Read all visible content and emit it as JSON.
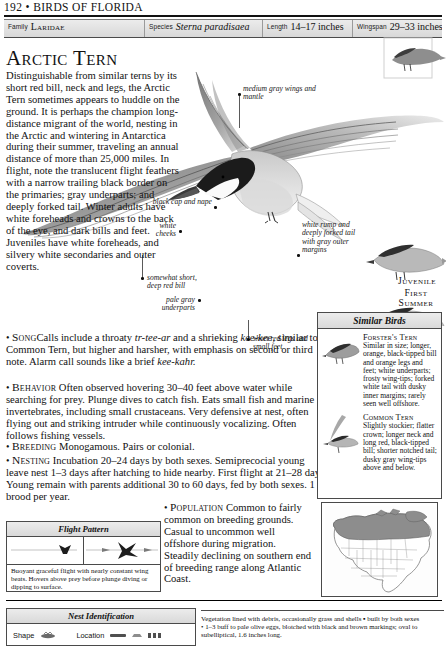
{
  "running_head": {
    "page_number": "192",
    "separator": "•",
    "book_title": "BIRDS OF FLORIDA"
  },
  "header_table": {
    "fields": [
      {
        "label": "Family",
        "value": "Laridae",
        "style": "small-caps"
      },
      {
        "label": "Species",
        "value": "Sterna paradisaea",
        "style": "italic"
      },
      {
        "label": "Length",
        "value": "14–17 inches",
        "style": "plain"
      },
      {
        "label": "Wingspan",
        "value": "29–33 inches",
        "style": "plain"
      }
    ]
  },
  "species": {
    "title": "Arctic Tern",
    "description": "Distinguishable from similar terns by its short red bill, neck and legs, the Arctic Tern sometimes appears to huddle on the ground. It is perhaps the champion long-distance migrant of the world, nesting in the Arctic and wintering in Antarctica during their summer, traveling an annual distance of more than 25,000 miles. In flight, note the translucent flight feathers with a narrow trailing black border on the primaries; gray underparts; and deeply forked tail. Winter adults have white foreheads and crowns to the back of the eye, and dark bills and feet. Juveniles have white foreheads, and silvery white secondaries and outer coverts."
  },
  "sections": [
    {
      "heading": "Song",
      "text_parts": [
        {
          "type": "plain",
          "text": "Calls include a throaty "
        },
        {
          "type": "italic",
          "text": "tr-tee-ar"
        },
        {
          "type": "plain",
          "text": " and a shrieking "
        },
        {
          "type": "italic",
          "text": "kee-kee,"
        },
        {
          "type": "plain",
          "text": " similar to Common Tern, but higher and harsher, with emphasis on second or third note. Alarm call sounds like a brief "
        },
        {
          "type": "italic",
          "text": "kee-kahr."
        }
      ]
    },
    {
      "heading": "Behavior",
      "text_parts": [
        {
          "type": "plain",
          "text": "Often observed hovering 30–40 feet above water while searching for prey. Plunge dives to catch fish. Eats small fish and marine invertebrates, including small crustaceans. Very defensive at nest, often flying out and striking intruder while continuously vocalizing. Often follows fishing vessels."
        }
      ]
    },
    {
      "heading": "Breeding",
      "text_parts": [
        {
          "type": "plain",
          "text": "Monogamous. Pairs or colonial."
        }
      ]
    },
    {
      "heading": "Nesting",
      "text_parts": [
        {
          "type": "plain",
          "text": "Incubation 20–24 days by both sexes. Semiprecocial young leave nest 1–3 days after hatching to hide nearby. First flight at 21–28 days. Young remain with parents additional 30 to 60 days, fed by both sexes. 1 brood per year."
        }
      ]
    },
    {
      "heading": "Population",
      "text_parts": [
        {
          "type": "plain",
          "text": "Common to fairly common on breeding grounds. Casual to uncommon well offshore during migration. Steadily declining on southern end of breeding range along Atlantic Coast."
        }
      ]
    }
  ],
  "annotations": [
    {
      "name": "medium-gray-wings-and-mantle",
      "text": "medium gray wings and mantle"
    },
    {
      "name": "black-cap-and-nape",
      "text": "black cap and nape"
    },
    {
      "name": "white-cheeks",
      "text": "white cheeks"
    },
    {
      "name": "somewhat-short-deep-red-bill",
      "text": "somewhat short, deep red bill"
    },
    {
      "name": "pale-gray-underparts",
      "text": "pale gray underparts"
    },
    {
      "name": "white-rump-forked-tail",
      "text": "white rump and deeply forked tail with gray outer margins"
    },
    {
      "name": "short-red-legs-small-feet",
      "text": "short red legs and small feet"
    }
  ],
  "plate_labels": [
    {
      "name": "juvenile",
      "text": "Juvenile"
    },
    {
      "name": "first-summer",
      "text": "First Summer"
    }
  ],
  "similar_birds": {
    "title": "Similar Birds",
    "entries": [
      {
        "name": "Forster's Tern",
        "description": "Similar in size; longer, orange, black-tipped bill and orange legs and feet; white underparts; frosty wing-tips; forked white tail with dusky inner margins; rarely seen well offshore."
      },
      {
        "name": "Common Tern",
        "description": "Slightly stockier; flatter crown; longer neck and long red, black-tipped bill; shorter notched tail; dusky gray wing-tips above and below."
      }
    ]
  },
  "flight_pattern": {
    "title": "Flight Pattern",
    "caption": "Buoyant graceful flight with nearly constant wing beats. Hovers above prey before plunge diving or dipping to surface."
  },
  "nest_identification": {
    "title": "Nest Identification",
    "shape_label": "Shape",
    "location_label": "Location",
    "description_lines": [
      "Vegetation lined with debris, occasionally grass and shells ▪ built by both sexes",
      "• 1–3 buff to pale olive eggs, blotched with black and brown markings; oval to",
      "subelliptical, 1.6 inches long."
    ]
  },
  "range_map": {
    "name": "north-america-range-map",
    "breeding_color": "#8d8d8d",
    "land_color": "#ffffff",
    "outline_color": "#5a5a5a"
  },
  "colors": {
    "ink": "#111111",
    "rule": "#4a4a4a",
    "bar_top": "#ececec",
    "bar_bottom": "#d8d8d8"
  }
}
